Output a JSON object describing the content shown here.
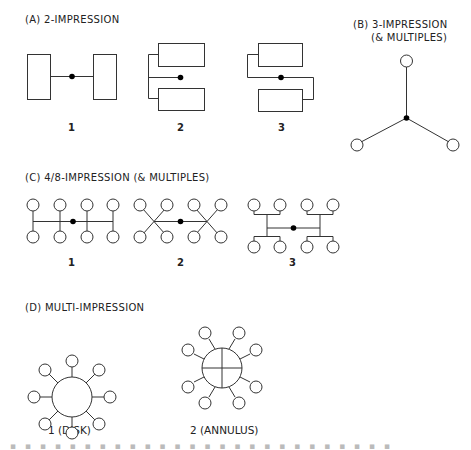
{
  "sections": {
    "a": {
      "title": "(A)  2-IMPRESSION",
      "layouts": [
        {
          "label": "1"
        },
        {
          "label": "2"
        },
        {
          "label": "3"
        }
      ]
    },
    "b": {
      "title_line1": "(B)  3-IMPRESSION",
      "title_line2": "(& MULTIPLES)"
    },
    "c": {
      "title": "(C)  4/8-IMPRESSION (& MULTIPLES)",
      "layouts": [
        {
          "label": "1"
        },
        {
          "label": "2"
        },
        {
          "label": "3"
        }
      ]
    },
    "d": {
      "title": "(D)  MULTI-IMPRESSION",
      "layouts": [
        {
          "label": "1 (DISK)"
        },
        {
          "label": "2 (ANNULUS)"
        }
      ]
    }
  },
  "caption": "Fig. 2.1  Some examples of runner layouts (partially visible)",
  "colors": {
    "line": "#333333",
    "sprue": "#000000",
    "background": "#ffffff"
  }
}
